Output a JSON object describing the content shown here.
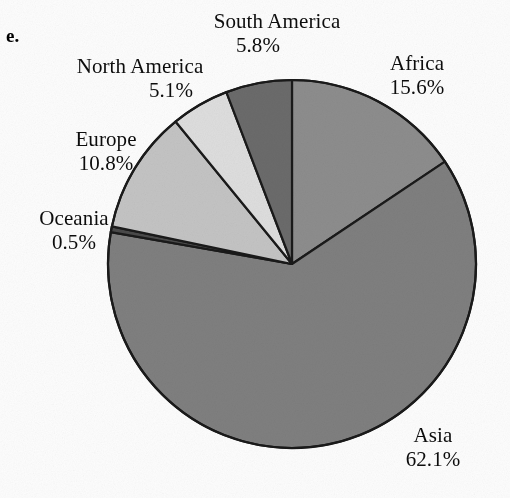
{
  "figure": {
    "panel_letter": "e.",
    "background_color": "#fdfdfd",
    "outline_color": "#1a1a1a"
  },
  "chart_data": {
    "type": "pie",
    "title": "",
    "subtitle": "",
    "xlabel": "",
    "ylabel": "",
    "legend_position": "none",
    "grid": false,
    "units": "percent",
    "start_angle_deg": 0,
    "direction": "clockwise",
    "categories": [
      "Africa",
      "Asia",
      "Oceania",
      "Europe",
      "North America",
      "South America"
    ],
    "values": [
      15.6,
      62.1,
      0.5,
      10.8,
      5.1,
      5.8
    ],
    "slices": [
      {
        "name": "Africa",
        "label": "Africa",
        "percent_text": "15.6%",
        "value": 15.6,
        "color": "#8d8d8d",
        "label_position": "right-top"
      },
      {
        "name": "Asia",
        "label": "Asia",
        "percent_text": "62.1%",
        "value": 62.1,
        "color": "#7f7f7f",
        "label_position": "bottom-right"
      },
      {
        "name": "Oceania",
        "label": "Oceania",
        "percent_text": "0.5%",
        "value": 0.5,
        "color": "#4a4a4a",
        "label_position": "left"
      },
      {
        "name": "Europe",
        "label": "Europe",
        "percent_text": "10.8%",
        "value": 10.8,
        "color": "#c4c4c4",
        "label_position": "left-top"
      },
      {
        "name": "North America",
        "label": "North America",
        "percent_text": "5.1%",
        "value": 5.1,
        "color": "#dedede",
        "label_position": "top-left"
      },
      {
        "name": "South America",
        "label": "South America",
        "percent_text": "5.8%",
        "value": 5.8,
        "color": "#6b6b6b",
        "label_position": "top"
      }
    ]
  }
}
